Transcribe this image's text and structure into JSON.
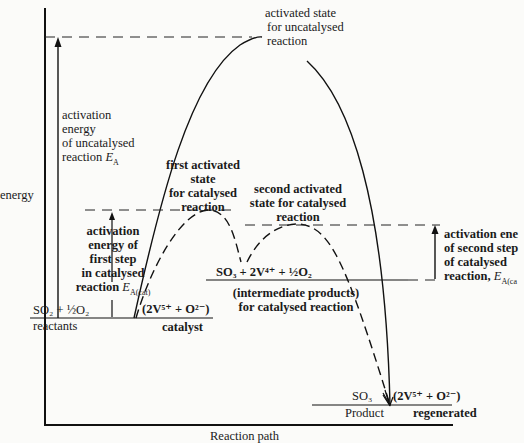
{
  "diagram": {
    "type": "energy-profile",
    "y_axis_label": "energy",
    "x_axis_label": "Reaction path",
    "uncatalysed": {
      "peak_label": [
        "activated state",
        "for uncatalysed",
        "reaction"
      ],
      "activation_energy_label": [
        "activation",
        "energy",
        "of uncatalysed",
        "reaction"
      ],
      "activation_energy_symbol": "E",
      "activation_energy_subscript": "A"
    },
    "catalysed": {
      "first_peak_label": [
        "first activated",
        "state",
        "for catalysed",
        "reaction"
      ],
      "second_peak_label": [
        "second activated",
        "state for catalysed",
        "reaction"
      ],
      "first_step_label": [
        "activation",
        "energy of",
        "first step",
        "in catalysed",
        "reaction"
      ],
      "first_step_symbol": "E",
      "first_step_subscript": "A(cat)",
      "second_step_label": [
        "activation ene",
        "of second step",
        "of catalysed",
        "reaction,"
      ],
      "second_step_symbol": "E",
      "second_step_subscript": "A(ca"
    },
    "reactants": {
      "formula": "SO₂ + ½O₂",
      "label": "reactants",
      "catalyst_formula": "(2V⁵⁺ + O²⁻)",
      "catalyst_label": "catalyst"
    },
    "intermediate": {
      "formula": "SO₃ + 2V⁴⁺ + ½O₂",
      "label": [
        "(intermediate products)",
        "for catalysed reaction"
      ]
    },
    "products": {
      "formula": "SO₃",
      "label": "Product",
      "catalyst_formula": "(2V⁵⁺ + O²⁻)",
      "catalyst_label": "regenerated"
    }
  }
}
